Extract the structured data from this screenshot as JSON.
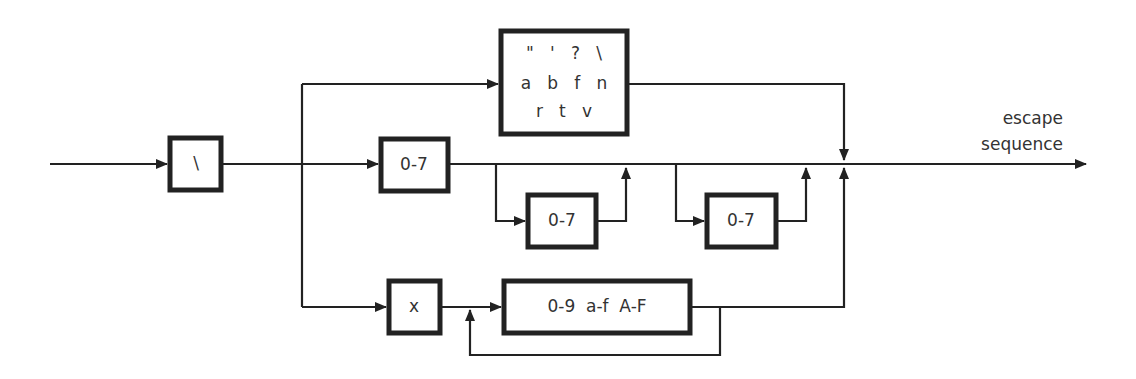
{
  "diagram": {
    "output_label_line1": "escape",
    "output_label_line2": "sequence",
    "colors": {
      "stroke": "#222222",
      "text": "#333333",
      "background": "#ffffff"
    },
    "boxes": {
      "backslash": "\\",
      "simple_escapes": {
        "row1": "\"   '   ?   \\",
        "row2": "a   b   f   n",
        "row3": "r   t   v"
      },
      "octal_1": "0-7",
      "octal_2": "0-7",
      "octal_3": "0-7",
      "hex_prefix": "x",
      "hex_digits": "0-9  a-f  A-F"
    }
  }
}
